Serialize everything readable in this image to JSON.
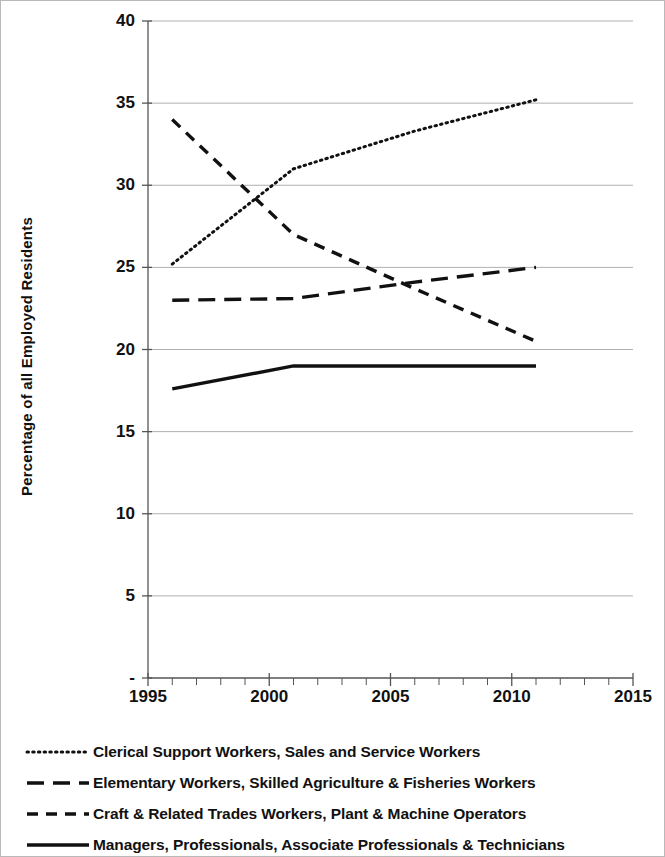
{
  "chart_data": {
    "type": "line",
    "title": "",
    "xlabel": "",
    "ylabel": "Percentage of all Employed Residents",
    "xlim": [
      1995,
      2015
    ],
    "ylim": [
      0,
      40
    ],
    "xticks": [
      "1995",
      "2000",
      "2005",
      "2010",
      "2015"
    ],
    "xtick_values": [
      1995,
      2000,
      2005,
      2010,
      2015
    ],
    "yticks": [
      "-",
      "5",
      "10",
      "15",
      "20",
      "25",
      "30",
      "35",
      "40"
    ],
    "ytick_values": [
      0,
      5,
      10,
      15,
      20,
      25,
      30,
      35,
      40
    ],
    "grid": "horizontal",
    "legend_position": "below",
    "x": [
      1996,
      2001,
      2006,
      2011
    ],
    "series": [
      {
        "name": "Clerical Support Workers, Sales and Service Workers",
        "style": "dotted",
        "values": [
          25.2,
          31.0,
          33.3,
          35.2
        ]
      },
      {
        "name": "Elementary Workers, Skilled Agriculture & Fisheries Workers",
        "style": "long-dash",
        "values": [
          23.0,
          23.1,
          24.1,
          25.0
        ]
      },
      {
        "name": "Craft & Related Trades Workers, Plant & Machine Operators",
        "style": "short-dash",
        "values": [
          34.0,
          27.0,
          23.7,
          20.5
        ]
      },
      {
        "name": "Managers, Professionals, Associate Professionals & Technicians",
        "style": "solid",
        "values": [
          17.6,
          19.0,
          19.0,
          19.0
        ]
      }
    ],
    "colors": {
      "line": "#111111",
      "grid": "#b0b0b0",
      "axis": "#555555",
      "background": "#ffffff"
    }
  },
  "legend": {
    "items": [
      {
        "label": "Clerical Support Workers, Sales and Service Workers",
        "key": "dotted-line-key"
      },
      {
        "label": "Elementary Workers, Skilled Agriculture & Fisheries Workers",
        "key": "long-dash-line-key"
      },
      {
        "label": "Craft & Related Trades Workers, Plant & Machine Operators",
        "key": "short-dash-line-key"
      },
      {
        "label": "Managers, Professionals, Associate Professionals & Technicians",
        "key": "solid-line-key"
      }
    ]
  }
}
